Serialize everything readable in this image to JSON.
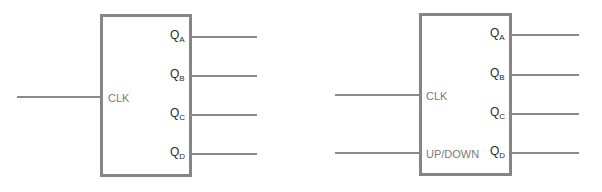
{
  "diagrams": [
    {
      "name": "counter",
      "inputs": [
        {
          "label": "CLK"
        }
      ],
      "outputs": [
        {
          "label": "Q",
          "subscript": "A"
        },
        {
          "label": "Q",
          "subscript": "B"
        },
        {
          "label": "Q",
          "subscript": "C"
        },
        {
          "label": "Q",
          "subscript": "D"
        }
      ]
    },
    {
      "name": "up-down-counter",
      "inputs": [
        {
          "label": "CLK"
        },
        {
          "label": "UP/DOWN"
        }
      ],
      "outputs": [
        {
          "label": "Q",
          "subscript": "A"
        },
        {
          "label": "Q",
          "subscript": "B"
        },
        {
          "label": "Q",
          "subscript": "C"
        },
        {
          "label": "Q",
          "subscript": "D"
        }
      ]
    }
  ],
  "colors": {
    "box_border": "#858585",
    "wire": "#8a8a8a",
    "input_text": "#7a7a7a",
    "output_text": "#2a2a2a"
  }
}
